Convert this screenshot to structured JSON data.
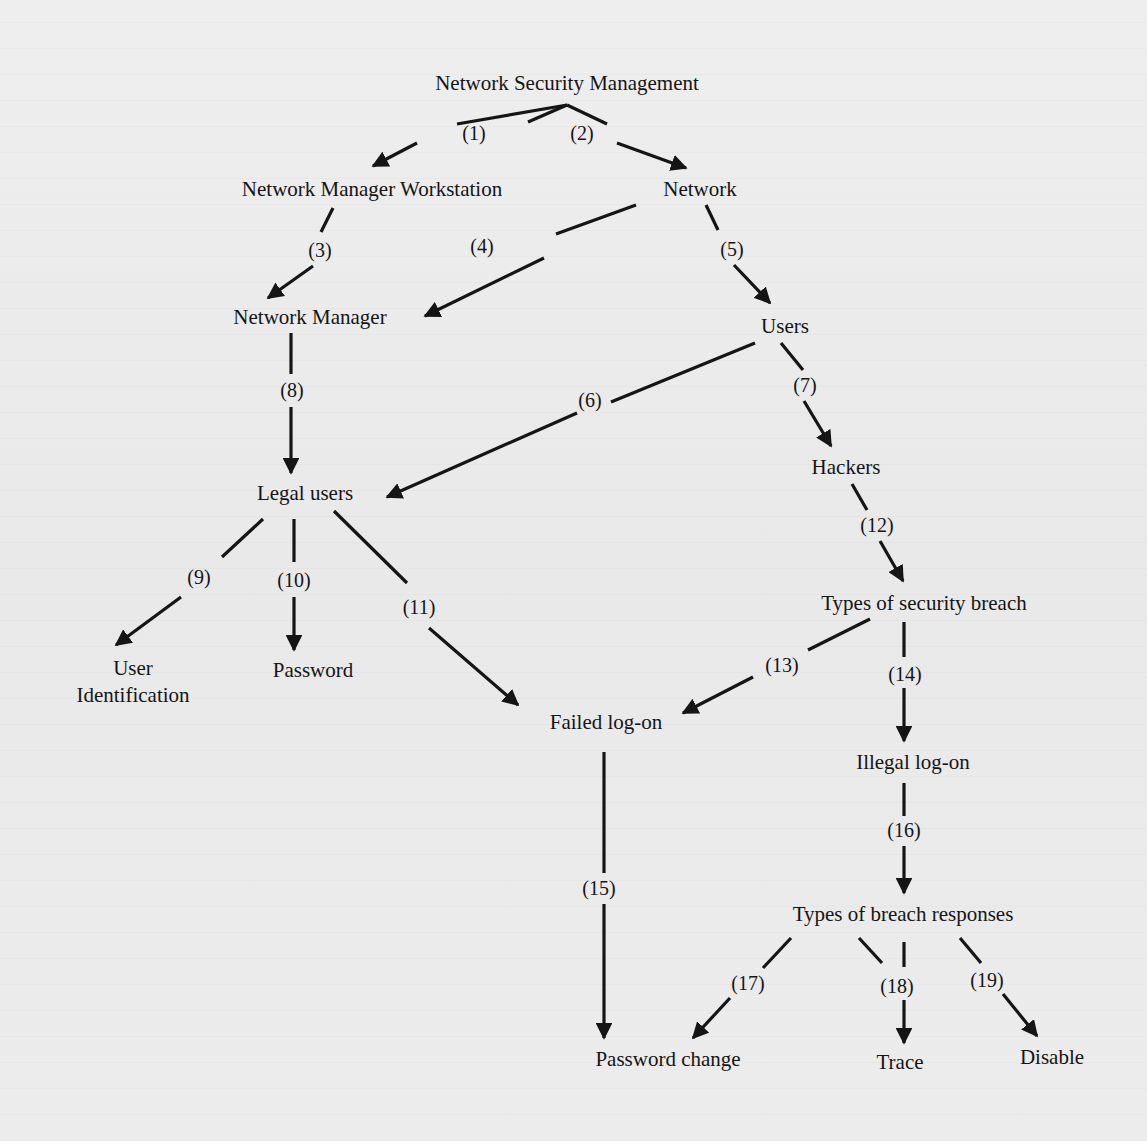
{
  "diagram": {
    "title": "Network Security Management",
    "nodes": {
      "root": "Network Security Management",
      "workstation": "Network Manager Workstation",
      "network": "Network",
      "manager": "Network Manager",
      "users": "Users",
      "legal_users": "Legal users",
      "hackers": "Hackers",
      "user_id_line1": "User",
      "user_id_line2": "Identification",
      "password": "Password",
      "breach_types": "Types of security breach",
      "failed_logon": "Failed log-on",
      "illegal_logon": "Illegal log-on",
      "response_types": "Types of breach responses",
      "password_change": "Password change",
      "trace": "Trace",
      "disable": "Disable"
    },
    "edges": [
      {
        "id": "1",
        "label": "(1)",
        "from": "Network Security Management",
        "to": "Network Manager Workstation"
      },
      {
        "id": "2",
        "label": "(2)",
        "from": "Network Security Management",
        "to": "Network"
      },
      {
        "id": "3",
        "label": "(3)",
        "from": "Network Manager Workstation",
        "to": "Network Manager"
      },
      {
        "id": "4",
        "label": "(4)",
        "from": "Network",
        "to": "Network Manager"
      },
      {
        "id": "5",
        "label": "(5)",
        "from": "Network",
        "to": "Users"
      },
      {
        "id": "6",
        "label": "(6)",
        "from": "Users",
        "to": "Legal users"
      },
      {
        "id": "7",
        "label": "(7)",
        "from": "Users",
        "to": "Hackers"
      },
      {
        "id": "8",
        "label": "(8)",
        "from": "Network Manager",
        "to": "Legal users"
      },
      {
        "id": "9",
        "label": "(9)",
        "from": "Legal users",
        "to": "User Identification"
      },
      {
        "id": "10",
        "label": "(10)",
        "from": "Legal users",
        "to": "Password"
      },
      {
        "id": "11",
        "label": "(11)",
        "from": "Legal users",
        "to": "Failed log-on"
      },
      {
        "id": "12",
        "label": "(12)",
        "from": "Hackers",
        "to": "Types of security breach"
      },
      {
        "id": "13",
        "label": "(13)",
        "from": "Types of security breach",
        "to": "Failed log-on"
      },
      {
        "id": "14",
        "label": "(14)",
        "from": "Types of security breach",
        "to": "Illegal log-on"
      },
      {
        "id": "15",
        "label": "(15)",
        "from": "Failed log-on",
        "to": "Password change"
      },
      {
        "id": "16",
        "label": "(16)",
        "from": "Illegal log-on",
        "to": "Types of breach responses"
      },
      {
        "id": "17",
        "label": "(17)",
        "from": "Types of breach responses",
        "to": "Password change"
      },
      {
        "id": "18",
        "label": "(18)",
        "from": "Types of breach responses",
        "to": "Trace"
      },
      {
        "id": "19",
        "label": "(19)",
        "from": "Types of breach responses",
        "to": "Disable"
      }
    ],
    "labels": {
      "e1": "(1)",
      "e2": "(2)",
      "e3": "(3)",
      "e4": "(4)",
      "e5": "(5)",
      "e6": "(6)",
      "e7": "(7)",
      "e8": "(8)",
      "e9": "(9)",
      "e10": "(10)",
      "e11": "(11)",
      "e12": "(12)",
      "e13": "(13)",
      "e14": "(14)",
      "e15": "(15)",
      "e16": "(16)",
      "e17": "(17)",
      "e18": "(18)",
      "e19": "(19)"
    },
    "colors": {
      "ink": "#151515",
      "paper": "#ececec"
    }
  }
}
